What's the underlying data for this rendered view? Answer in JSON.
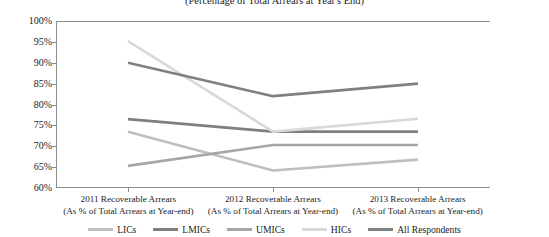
{
  "chart_data": {
    "type": "line",
    "title": "(Percentage of Total Arrears at Year's End)",
    "xlabel": "",
    "ylabel": "",
    "ylim": [
      60,
      100
    ],
    "ytick_step": 5,
    "grid": false,
    "legend_position": "bottom",
    "ytick_labels": [
      "100%",
      "95%",
      "90%",
      "85%",
      "80%",
      "75%",
      "70%",
      "65%",
      "60%"
    ],
    "ytick_values": [
      100,
      95,
      90,
      85,
      80,
      75,
      70,
      65,
      60
    ],
    "categories": [
      "2011 Recoverable Arrears",
      "2012 Recoverable Arrears",
      "2013 Recoverable Arrears"
    ],
    "category_sublabels": [
      "(As % of Total Arrears at Year-end)",
      "(As % of Total Arrears at Year-end)",
      "(As % of Total Arrears at Year-end)"
    ],
    "series": [
      {
        "name": "LICs",
        "color": "#bfbfbf",
        "values": [
          73.5,
          64.2,
          66.8
        ]
      },
      {
        "name": "LMICs",
        "color": "#7f7f7f",
        "values": [
          76.5,
          73.5,
          73.5
        ]
      },
      {
        "name": "UMICs",
        "color": "#a6a6a6",
        "values": [
          65.3,
          70.3,
          70.3
        ]
      },
      {
        "name": "HICs",
        "color": "#d9d9d9",
        "values": [
          95.2,
          73.5,
          76.6
        ]
      },
      {
        "name": "All Respondents",
        "color": "#808080",
        "values": [
          90.0,
          82.0,
          85.0
        ]
      }
    ]
  },
  "axis": {
    "frame_color": "#8d8d8d"
  }
}
